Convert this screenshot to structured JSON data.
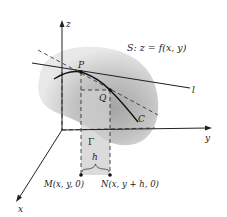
{
  "figure": {
    "surface_label": "S:  z = f(x, y)",
    "axis_z": "z",
    "axis_y": "y",
    "axis_x": "x",
    "point_P": "P",
    "point_Q": "Q",
    "curve_C": "C",
    "line_l": "l",
    "region_Gamma": "Γ",
    "width_h": "h",
    "point_M": "M(x, y, 0)",
    "point_N": "N(x, y + h, 0)"
  },
  "colors": {
    "surface_light": "#d9d9d9",
    "surface_dark": "#a8a8a8",
    "strip_fill": "#dcdcdc",
    "ink": "#222222"
  }
}
